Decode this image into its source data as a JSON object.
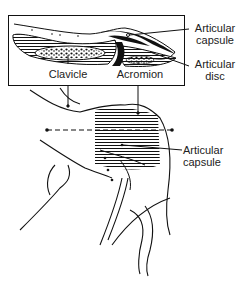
{
  "diagram": {
    "type": "anatomical-illustration",
    "inset_box": {
      "labels": {
        "clavicle": "Clavicle",
        "acromion": "Acromion"
      }
    },
    "callouts": {
      "articular_capsule_top": {
        "line1": "Articular",
        "line2": "capsule"
      },
      "articular_disc": {
        "line1": "Articular",
        "line2": "disc"
      },
      "articular_capsule_bottom": {
        "line1": "Articular",
        "line2": "capsule"
      }
    },
    "section_line": {
      "style": "dashed"
    },
    "colors": {
      "ink": "#111111",
      "background": "#ffffff"
    }
  }
}
